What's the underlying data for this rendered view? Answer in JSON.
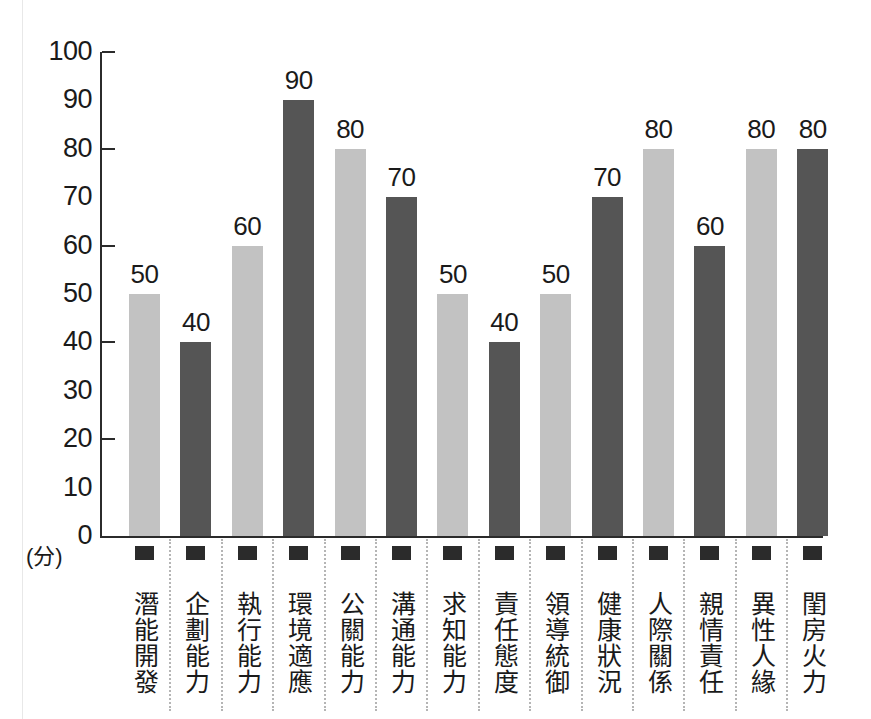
{
  "chart_data": {
    "type": "bar",
    "title": "",
    "xlabel": "",
    "ylabel": "(分)",
    "ylim": [
      0,
      100
    ],
    "ytick_step": 10,
    "ytick_labels": [
      "100",
      "90",
      "80",
      "70",
      "60",
      "50",
      "40",
      "30",
      "20",
      "10",
      "0"
    ],
    "ytick_values": [
      100,
      90,
      80,
      70,
      60,
      50,
      40,
      30,
      20,
      10,
      0
    ],
    "major_ticks": [
      100,
      80,
      60,
      40,
      20
    ],
    "grid": false,
    "legend": "none",
    "categories": [
      "潛能開發",
      "企劃能力",
      "執行能力",
      "環境適應",
      "公關能力",
      "溝通能力",
      "求知能力",
      "責任態度",
      "領導統御",
      "健康狀況",
      "人際關係",
      "親情責任",
      "異性人緣",
      "閨房火力"
    ],
    "values": [
      50,
      40,
      60,
      90,
      80,
      70,
      50,
      40,
      50,
      70,
      80,
      60,
      80,
      80
    ],
    "value_labels": [
      "50",
      "40",
      "60",
      "90",
      "80",
      "70",
      "50",
      "40",
      "50",
      "70",
      "80",
      "60",
      "80",
      "80"
    ],
    "bar_colors": [
      "#c2c2c2",
      "#555555",
      "#c2c2c2",
      "#555555",
      "#c2c2c2",
      "#555555",
      "#c2c2c2",
      "#555555",
      "#c2c2c2",
      "#555555",
      "#c2c2c2",
      "#555555",
      "#c2c2c2",
      "#555555"
    ],
    "bar_shades": [
      "light",
      "dark",
      "light",
      "dark",
      "light",
      "dark",
      "light",
      "dark",
      "light",
      "dark",
      "light",
      "dark",
      "light",
      "dark"
    ],
    "colors": {
      "light_bar": "#c2c2c2",
      "dark_bar": "#555555",
      "axis": "#2b2b2b",
      "text": "#1a1a1a",
      "separator": "#b5b5b5",
      "background": "#ffffff"
    }
  },
  "axis": {
    "unit_label": "(分)"
  }
}
